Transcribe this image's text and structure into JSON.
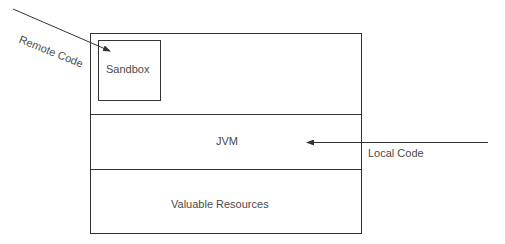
{
  "diagram": {
    "labels": {
      "sandbox": "Sandbox",
      "jvm": "JVM",
      "resources": "Valuable Resources",
      "remote": "Remote Code",
      "local": "Local Code"
    },
    "colors": {
      "line": "#333333",
      "text": "#4a4a4a"
    }
  }
}
